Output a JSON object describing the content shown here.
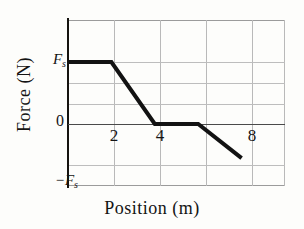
{
  "chart_data": {
    "type": "line",
    "title": "",
    "xlabel": "Position (m)",
    "ylabel": "Force (N)",
    "xlim": [
      0,
      10
    ],
    "ylim": [
      -1,
      1.6
    ],
    "grid": true,
    "legend": null,
    "x_ticks": [
      {
        "value": 2,
        "label": "2"
      },
      {
        "value": 4,
        "label": "4"
      },
      {
        "value": 8,
        "label": "8"
      }
    ],
    "y_ticks": [
      {
        "value": 1,
        "label": "F",
        "sublabel": "s"
      },
      {
        "value": 0,
        "label": "0",
        "sublabel": ""
      },
      {
        "value": -1,
        "label": "−F",
        "sublabel": "s"
      }
    ],
    "y_unit_symbol": "F_s",
    "x_gridlines": [
      0,
      2,
      4,
      6,
      8,
      10
    ],
    "y_gridlines": [
      1.6,
      1.4,
      1.0,
      0.6,
      0.2,
      0.0,
      -0.4,
      -1.0
    ],
    "series": [
      {
        "name": "Force vs Position",
        "color": "#121212",
        "line_width": 4,
        "points": [
          {
            "x": 0,
            "y": 1.0
          },
          {
            "x": 2,
            "y": 1.0
          },
          {
            "x": 4,
            "y": 0.0
          },
          {
            "x": 6,
            "y": 0.0
          },
          {
            "x": 8,
            "y": -0.55
          }
        ]
      }
    ],
    "description_segments": [
      "constant at F_s from x=0 to x=2",
      "linear decrease from F_s to 0 between x=2 and x=4",
      "zero from x=4 to x=6",
      "linear decrease from 0 to about -0.55 F_s between x=6 and x=8"
    ]
  },
  "axes": {
    "x_title": "Position (m)",
    "y_title": "Force (N)",
    "y_top_label_main": "F",
    "y_top_label_sub": "s",
    "y_zero_label": "0",
    "y_bottom_label_main": "−F",
    "y_bottom_label_sub": "s",
    "x_tick_2": "2",
    "x_tick_4": "4",
    "x_tick_8": "8"
  }
}
